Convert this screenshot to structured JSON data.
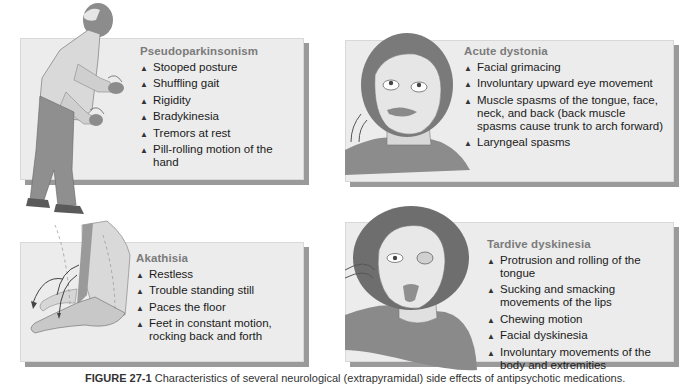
{
  "figure": {
    "caption_label": "FIGURE 27-1",
    "caption_text": " Characteristics of several neurological (extrapyramidal) side effects of antipsychotic medications."
  },
  "panels": [
    {
      "id": "pseudoparkinsonism",
      "title": "Pseudoparkinsonism",
      "illustration": "stooped-elderly-man-with-hand-tremors",
      "items": [
        "Stooped posture",
        "Shuffling gait",
        "Rigidity",
        "Bradykinesia",
        "Tremors at rest",
        "Pill-rolling motion of the hand"
      ]
    },
    {
      "id": "acute-dystonia",
      "title": "Acute dystonia",
      "illustration": "face-with-grimace-and-upward-eyes",
      "items": [
        "Facial grimacing",
        "Involuntary upward eye movement",
        "Muscle spasms of the tongue, face, neck, and back (back muscle spasms cause trunk to arch forward)",
        "Laryngeal spasms"
      ]
    },
    {
      "id": "akathisia",
      "title": "Akathisia",
      "illustration": "restless-foot-with-motion-arrows",
      "items": [
        "Restless",
        "Trouble standing still",
        "Paces the floor",
        "Feet in constant motion, rocking back and forth"
      ]
    },
    {
      "id": "tardive-dyskinesia",
      "title": "Tardive dyskinesia",
      "illustration": "woman-with-protruding-tongue",
      "items": [
        "Protrusion and rolling of the tongue",
        "Sucking and smacking movements of the lips",
        "Chewing motion",
        "Facial dyskinesia",
        "Involuntary movements of the body and extremities"
      ]
    }
  ],
  "bullet_icon": "▲",
  "colors": {
    "panel_bg": "#ececec",
    "panel_shadow": "#9a9a9a",
    "title_gray": "#7b7b7b",
    "text": "#1a1a1a"
  }
}
